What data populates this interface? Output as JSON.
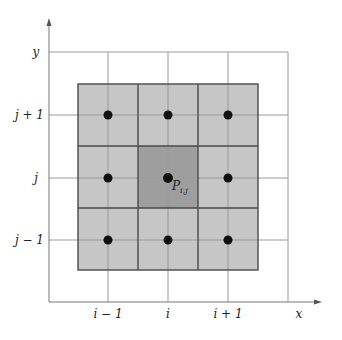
{
  "diagram": {
    "title": "",
    "axes": {
      "x_label": "x",
      "y_label": "y"
    },
    "x_ticks": [
      "i − 1",
      "i",
      "i + 1"
    ],
    "y_ticks": [
      "j + 1",
      "j",
      "j − 1"
    ],
    "center_point_label": "P",
    "center_point_subscript": "i,j",
    "colors": {
      "shaded_cell": "#c4c4c4",
      "center_cell": "#9c9c9c",
      "grid_line": "#9a9a9a",
      "cell_border": "#4a4a4a",
      "node": "#111111",
      "axis": "#777777"
    },
    "nodes": [
      {
        "col": "i − 1",
        "row": "j + 1"
      },
      {
        "col": "i",
        "row": "j + 1"
      },
      {
        "col": "i + 1",
        "row": "j + 1"
      },
      {
        "col": "i − 1",
        "row": "j"
      },
      {
        "col": "i",
        "row": "j"
      },
      {
        "col": "i + 1",
        "row": "j"
      },
      {
        "col": "i − 1",
        "row": "j − 1"
      },
      {
        "col": "i",
        "row": "j − 1"
      },
      {
        "col": "i + 1",
        "row": "j − 1"
      }
    ]
  }
}
